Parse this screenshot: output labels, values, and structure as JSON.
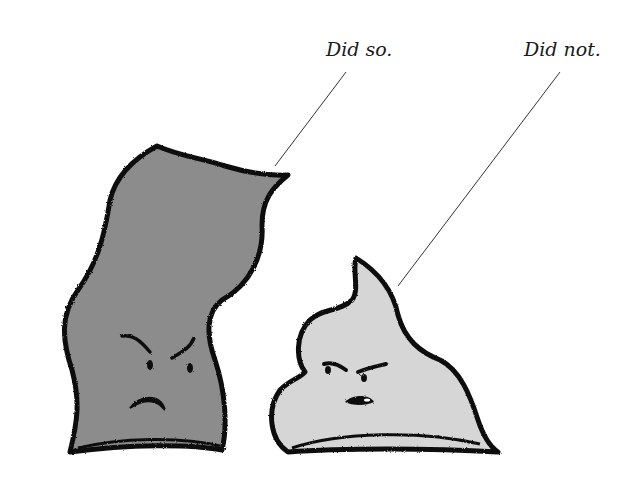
{
  "captions": {
    "left_character": "Did so.",
    "right_character": "Did not."
  },
  "characters": [
    {
      "name": "tall-dark-character",
      "fill": "#8c8c8c",
      "expression": "angry"
    },
    {
      "name": "short-light-character",
      "fill": "#d6d6d6",
      "expression": "scowling"
    }
  ],
  "colors": {
    "background": "#ffffff",
    "outline": "#111111",
    "pointer_line": "#333333"
  }
}
